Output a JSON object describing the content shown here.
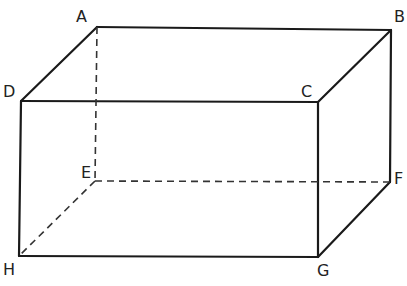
{
  "diagram": {
    "type": "cuboid",
    "stroke_color": "#1a1a1a",
    "background": "#ffffff",
    "vertices": {
      "A": {
        "label": "A",
        "x": 97,
        "y": 27
      },
      "B": {
        "label": "B",
        "x": 391,
        "y": 30
      },
      "C": {
        "label": "C",
        "x": 318,
        "y": 102
      },
      "D": {
        "label": "D",
        "x": 21,
        "y": 101
      },
      "E": {
        "label": "E",
        "x": 95,
        "y": 181
      },
      "F": {
        "label": "F",
        "x": 390,
        "y": 182
      },
      "G": {
        "label": "G",
        "x": 318,
        "y": 257
      },
      "H": {
        "label": "H",
        "x": 19,
        "y": 256
      }
    },
    "solid_edges": [
      "AB",
      "BC",
      "CD",
      "DA",
      "DH",
      "HG",
      "GC",
      "GF",
      "FB"
    ],
    "dashed_edges": [
      "AE",
      "EF",
      "EH"
    ],
    "labels": {
      "A": "A",
      "B": "B",
      "C": "C",
      "D": "D",
      "E": "E",
      "F": "F",
      "G": "G",
      "H": "H"
    }
  }
}
